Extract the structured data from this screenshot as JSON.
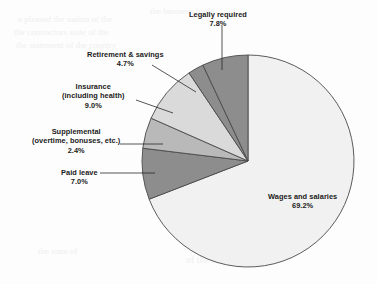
{
  "figure": {
    "background_color": "#fdfdfd",
    "outline_color": "#4a4a4a"
  },
  "bleed_text": [
    {
      "text": "a pleased the nation of the",
      "x": 18,
      "y": 14,
      "size": 9
    },
    {
      "text": "the contractors state of the",
      "x": 14,
      "y": 27,
      "size": 9
    },
    {
      "text": "the statement of the country",
      "x": 16,
      "y": 40,
      "size": 9
    },
    {
      "text": "the business trade",
      "x": 150,
      "y": 6,
      "size": 9
    },
    {
      "text": "of the reported of",
      "x": 232,
      "y": 96,
      "size": 9
    },
    {
      "text": "the reported and of",
      "x": 226,
      "y": 118,
      "size": 9
    },
    {
      "text": "the continue of",
      "x": 214,
      "y": 140,
      "size": 9
    },
    {
      "text": "the statements",
      "x": 210,
      "y": 162,
      "size": 9
    },
    {
      "text": "a continue of the state",
      "x": 212,
      "y": 184,
      "size": 9
    },
    {
      "text": "and intermediate",
      "x": 190,
      "y": 236,
      "size": 10
    },
    {
      "text": "of the country and the",
      "x": 186,
      "y": 254,
      "size": 10
    },
    {
      "text": "the state of",
      "x": 38,
      "y": 246,
      "size": 9
    }
  ],
  "chart_data": {
    "type": "pie",
    "title": "",
    "subtitle": "",
    "units": "percent of total employer compensation cost",
    "total": 100.0,
    "center": {
      "x": 248,
      "y": 161
    },
    "radius": 106,
    "start_angle_deg": -90,
    "direction": "clockwise",
    "legend_position": "callout-labels",
    "grid": false,
    "categories": [
      "Wages and salaries",
      "Legally required",
      "Retirement & savings",
      "Insurance (including health)",
      "Supplemental (overtime, bonuses, etc.)",
      "Paid leave"
    ],
    "values": [
      69.2,
      7.8,
      4.7,
      9.0,
      2.4,
      7.0
    ],
    "slices": [
      {
        "name": "wages-and-salaries",
        "label_line1": "Wages and salaries",
        "label_line2": "69.2%",
        "value": 69.2,
        "color": "#f1f1f1",
        "label_x": 268,
        "label_y": 192,
        "label_align": "center",
        "leader": false
      },
      {
        "name": "legally-required",
        "label_line1": "Legally required",
        "label_line2": "7.8%",
        "value": 7.8,
        "color": "#8d8d8d",
        "label_x": 189,
        "label_y": 10,
        "label_align": "center",
        "leader": true
      },
      {
        "name": "retirement-and-savings",
        "label_line1": "Retirement & savings",
        "label_line2": "4.7%",
        "value": 4.7,
        "color": "#b9b9b9",
        "label_x": 87,
        "label_y": 50,
        "label_align": "center",
        "leader": true
      },
      {
        "name": "insurance-including-health",
        "label_line1": "Insurance",
        "label_line2": "(including health)",
        "label_line3": "9.0%",
        "value": 9.0,
        "color": "#dadada",
        "label_x": 62,
        "label_y": 82,
        "label_align": "center",
        "leader": true
      },
      {
        "name": "supplemental",
        "label_line1": "Supplemental",
        "label_line2": "(overtime, bonuses, etc.)",
        "label_line3": "2.4%",
        "value": 2.4,
        "color": "#8d8d8d",
        "label_x": 32,
        "label_y": 127,
        "label_align": "center",
        "leader": true
      },
      {
        "name": "paid-leave",
        "label_line1": "Paid leave",
        "label_line2": "7.0%",
        "value": 7.0,
        "color": "#8d8d8d",
        "label_x": 61,
        "label_y": 168,
        "label_align": "center",
        "leader": true
      }
    ]
  }
}
